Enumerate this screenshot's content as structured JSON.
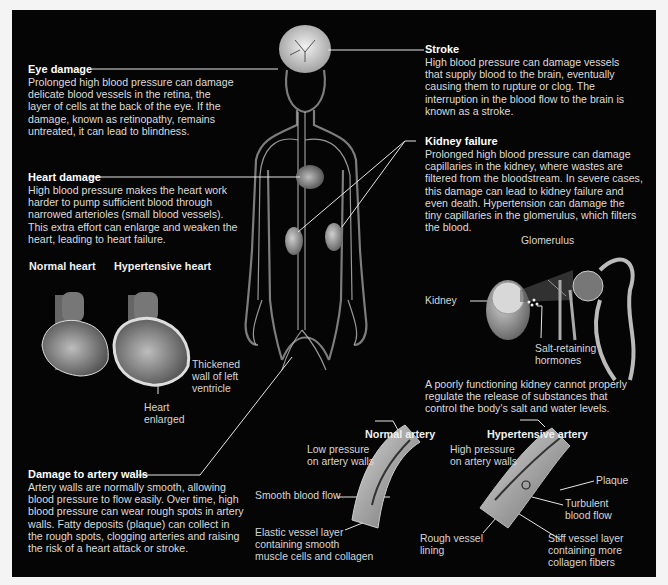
{
  "figure": {
    "background": "#050505",
    "text_color": "#dcdcdc",
    "heading_color": "#ffffff"
  },
  "eye_damage": {
    "title": "Eye damage",
    "lines": [
      "Prolonged high blood pressure can damage",
      "delicate blood vessels in the retina, the",
      "layer of cells at the back of the eye. If the",
      "damage, known as retinopathy, remains",
      "untreated, it can lead to blindness."
    ]
  },
  "heart_damage": {
    "title": "Heart damage",
    "lines": [
      "High blood pressure makes the heart work",
      "harder to pump sufficient blood through",
      "narrowed arterioles (small blood vessels).",
      "This extra effort can enlarge and weaken the",
      "heart, leading to heart failure."
    ],
    "normal_heart_label": "Normal heart",
    "hypertensive_heart_label": "Hypertensive heart",
    "thickened_wall_label": [
      "Thickened",
      "wall of left",
      "ventricle"
    ],
    "heart_enlarged_label": [
      "Heart",
      "enlarged"
    ]
  },
  "artery_damage": {
    "title": "Damage to artery walls",
    "lines": [
      "Artery walls are normally smooth, allowing",
      "blood pressure to flow easily. Over time, high",
      "blood pressure can wear rough spots in artery",
      "walls. Fatty deposits (plaque) can collect in",
      "the rough spots, clogging arteries and raising",
      "the risk of a heart attack or stroke."
    ]
  },
  "stroke": {
    "title": "Stroke",
    "lines": [
      "High blood pressure can damage vessels",
      "that supply blood to the brain, eventually",
      "causing them to rupture or clog. The",
      "interruption in the blood flow to the brain is",
      "known as a stroke."
    ]
  },
  "kidney_failure": {
    "title": "Kidney failure",
    "lines": [
      "Prolonged high blood pressure can damage",
      "capillaries in the kidney, where wastes are",
      "filtered from the bloodstream. In severe cases,",
      "this damage can lead to kidney failure and",
      "even death. Hypertension can damage the",
      "tiny capillaries in the glomerulus, which filters",
      "the blood."
    ],
    "glomerulus_label": "Glomerulus",
    "kidney_label": "Kidney",
    "hormones_label": [
      "Salt-retaining",
      "hormones"
    ],
    "note_lines": [
      "A poorly functioning kidney cannot properly",
      "regulate the release of substances that",
      "control the body's salt and water levels."
    ]
  },
  "normal_artery": {
    "title": "Normal artery",
    "low_pressure_label": [
      "Low pressure",
      "on artery walls"
    ],
    "smooth_flow_label": "Smooth blood flow",
    "elastic_layer_label": [
      "Elastic vessel layer",
      "containing smooth",
      "muscle cells and collagen"
    ]
  },
  "hypertensive_artery": {
    "title": "Hypertensive artery",
    "high_pressure_label": [
      "High pressure",
      "on artery walls"
    ],
    "plaque_label": "Plaque",
    "turbulent_label": [
      "Turbulent",
      "blood flow"
    ],
    "rough_lining_label": [
      "Rough vessel",
      "lining"
    ],
    "stiff_layer_label": [
      "Stiff vessel layer",
      "containing more",
      "collagen fibers"
    ]
  }
}
